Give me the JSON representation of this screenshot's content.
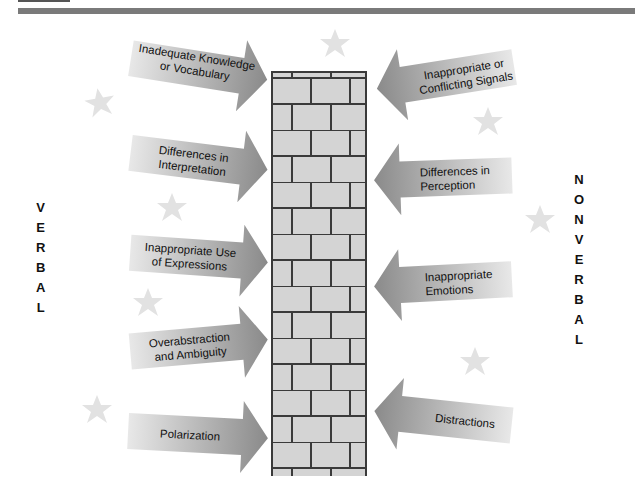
{
  "diagram": {
    "left_label": "VERBAL",
    "right_label": "NONVERBAL",
    "center": "brick-wall",
    "colors": {
      "arrow_dark": "#8a8a8a",
      "arrow_light": "#e6e6e6",
      "brick_fill": "#d4d4d4",
      "mortar": "#3a3a3a",
      "star": "#e2e2e2",
      "header_bar": "#7a7a7a"
    },
    "verbal_barriers": [
      {
        "line1": "Inadequate Knowledge",
        "line2": "or Vocabulary"
      },
      {
        "line1": "Differences in",
        "line2": "Interpretation"
      },
      {
        "line1": "Inappropriate Use",
        "line2": "of Expressions"
      },
      {
        "line1": "Overabstraction",
        "line2": "and Ambiguity"
      },
      {
        "line1": "Polarization",
        "line2": ""
      }
    ],
    "nonverbal_barriers": [
      {
        "line1": "Inappropriate or",
        "line2": "Conflicting Signals"
      },
      {
        "line1": "Differences in",
        "line2": "Perception"
      },
      {
        "line1": "Inappropriate",
        "line2": "Emotions"
      },
      {
        "line1": "Distractions",
        "line2": ""
      }
    ],
    "stars": [
      "star-icon",
      "star-icon",
      "star-icon",
      "star-icon",
      "star-icon",
      "star-icon",
      "star-icon",
      "star-icon"
    ]
  }
}
